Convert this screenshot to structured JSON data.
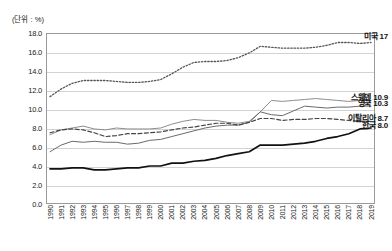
{
  "unit_label": "(단위 : %)",
  "chart_data": {
    "type": "line",
    "title": "",
    "subtitle": "",
    "xlabel": "",
    "ylabel": "",
    "unit": "(단위 : %)",
    "grid": true,
    "legend_position": "inline-right",
    "ylim": [
      0.0,
      18.0
    ],
    "ytick_labels": [
      "0.0",
      "2.0",
      "4.0",
      "6.0",
      "8.0",
      "10.0",
      "12.0",
      "14.0",
      "16.0",
      "18.0"
    ],
    "ytick_values": [
      0.0,
      2.0,
      4.0,
      6.0,
      8.0,
      10.0,
      12.0,
      14.0,
      16.0,
      18.0
    ],
    "categories": [
      "1990",
      "1991",
      "1992",
      "1993",
      "1994",
      "1995",
      "1996",
      "1997",
      "1998",
      "1999",
      "2000",
      "2001",
      "2002",
      "2003",
      "2004",
      "2005",
      "2006",
      "2007",
      "2008",
      "2009",
      "2010",
      "2011",
      "2012",
      "2013",
      "2014",
      "2015",
      "2016",
      "2017",
      "2018",
      "2019"
    ],
    "x": [
      1990,
      1991,
      1992,
      1993,
      1994,
      1995,
      1996,
      1997,
      1998,
      1999,
      2000,
      2001,
      2002,
      2003,
      2004,
      2005,
      2006,
      2007,
      2008,
      2009,
      2010,
      2011,
      2012,
      2013,
      2014,
      2015,
      2016,
      2017,
      2018,
      2019
    ],
    "series": [
      {
        "name": "미국",
        "label": "미국  17",
        "end_value": 17.0,
        "style": "dotted",
        "color": "#555555",
        "width": 1.3,
        "values": [
          11.3,
          12.1,
          12.7,
          13.0,
          13.0,
          13.0,
          12.9,
          12.8,
          12.8,
          12.9,
          13.1,
          13.7,
          14.4,
          14.9,
          15.0,
          15.0,
          15.1,
          15.4,
          15.9,
          16.6,
          16.5,
          16.4,
          16.4,
          16.4,
          16.5,
          16.7,
          17.0,
          17.0,
          16.9,
          17.0
        ]
      },
      {
        "name": "스웨덴",
        "label": "스웨덴  10.9",
        "end_value": 10.9,
        "style": "solid",
        "color": "#8d8d8d",
        "width": 1.0,
        "values": [
          7.3,
          7.8,
          8.0,
          8.2,
          7.9,
          7.8,
          8.0,
          7.9,
          7.9,
          7.9,
          8.0,
          8.4,
          8.7,
          8.9,
          8.8,
          8.8,
          8.6,
          8.5,
          8.7,
          9.7,
          10.9,
          10.8,
          10.9,
          11.0,
          11.1,
          11.0,
          10.9,
          10.8,
          10.9,
          10.9
        ]
      },
      {
        "name": "영국",
        "label": "영국  10.3",
        "end_value": 10.3,
        "style": "solid",
        "color": "#6a6a6a",
        "width": 1.0,
        "values": [
          5.5,
          6.2,
          6.6,
          6.5,
          6.6,
          6.5,
          6.5,
          6.3,
          6.4,
          6.7,
          6.8,
          7.1,
          7.4,
          7.7,
          8.0,
          8.2,
          8.3,
          8.3,
          8.6,
          9.7,
          9.4,
          9.3,
          9.8,
          10.3,
          10.2,
          10.1,
          10.2,
          10.2,
          10.3,
          10.3
        ]
      },
      {
        "name": "이탈리아",
        "label": "이탈리아  8.7",
        "end_value": 8.7,
        "style": "dashed",
        "color": "#444444",
        "width": 1.2,
        "values": [
          7.5,
          7.8,
          7.9,
          7.8,
          7.5,
          7.1,
          7.2,
          7.4,
          7.4,
          7.5,
          7.6,
          7.8,
          8.0,
          8.1,
          8.3,
          8.5,
          8.5,
          8.3,
          8.6,
          9.0,
          9.0,
          8.8,
          8.9,
          8.9,
          9.0,
          9.0,
          8.9,
          8.8,
          8.7,
          8.7
        ]
      },
      {
        "name": "한국",
        "label": "한국  8.0",
        "end_value": 8.0,
        "style": "solid",
        "color": "#111111",
        "width": 1.7,
        "values": [
          3.7,
          3.7,
          3.8,
          3.8,
          3.6,
          3.6,
          3.7,
          3.8,
          3.8,
          4.0,
          4.0,
          4.3,
          4.3,
          4.5,
          4.6,
          4.8,
          5.1,
          5.3,
          5.5,
          6.2,
          6.2,
          6.2,
          6.3,
          6.4,
          6.6,
          6.9,
          7.1,
          7.4,
          7.9,
          8.0
        ]
      }
    ],
    "annotations": [
      {
        "text": "미국  17",
        "series": "미국"
      },
      {
        "text": "스웨덴  10.9",
        "series": "스웨덴"
      },
      {
        "text": "영국  10.3",
        "series": "영국"
      },
      {
        "text": "이탈리아  8.7",
        "series": "이탈리아"
      },
      {
        "text": "한국  8.0",
        "series": "한국"
      }
    ]
  }
}
